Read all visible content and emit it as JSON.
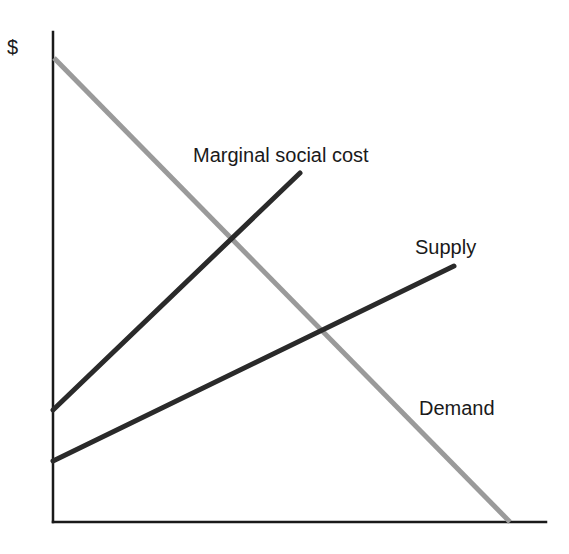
{
  "diagram": {
    "axes": {
      "y_label": "$",
      "x_label": "",
      "color": "#1a1a1a"
    },
    "labels": {
      "marginal_social_cost": "Marginal social cost",
      "supply": "Supply",
      "demand": "Demand"
    },
    "colors": {
      "marginal_social_cost": "#2a2a2a",
      "supply": "#2a2a2a",
      "demand": "#9a9a9a",
      "axis": "#1a1a1a"
    },
    "lines": [
      {
        "name": "Marginal social cost",
        "x1": 53,
        "y1": 410,
        "x2": 300,
        "y2": 173
      },
      {
        "name": "Supply",
        "x1": 53,
        "y1": 461,
        "x2": 454,
        "y2": 266
      },
      {
        "name": "Demand",
        "x1": 54,
        "y1": 58,
        "x2": 510,
        "y2": 522
      }
    ],
    "intersections": [
      {
        "between": [
          "Marginal social cost",
          "Demand"
        ],
        "x": 231,
        "y": 235
      },
      {
        "between": [
          "Supply",
          "Demand"
        ],
        "x": 322,
        "y": 330
      }
    ]
  }
}
